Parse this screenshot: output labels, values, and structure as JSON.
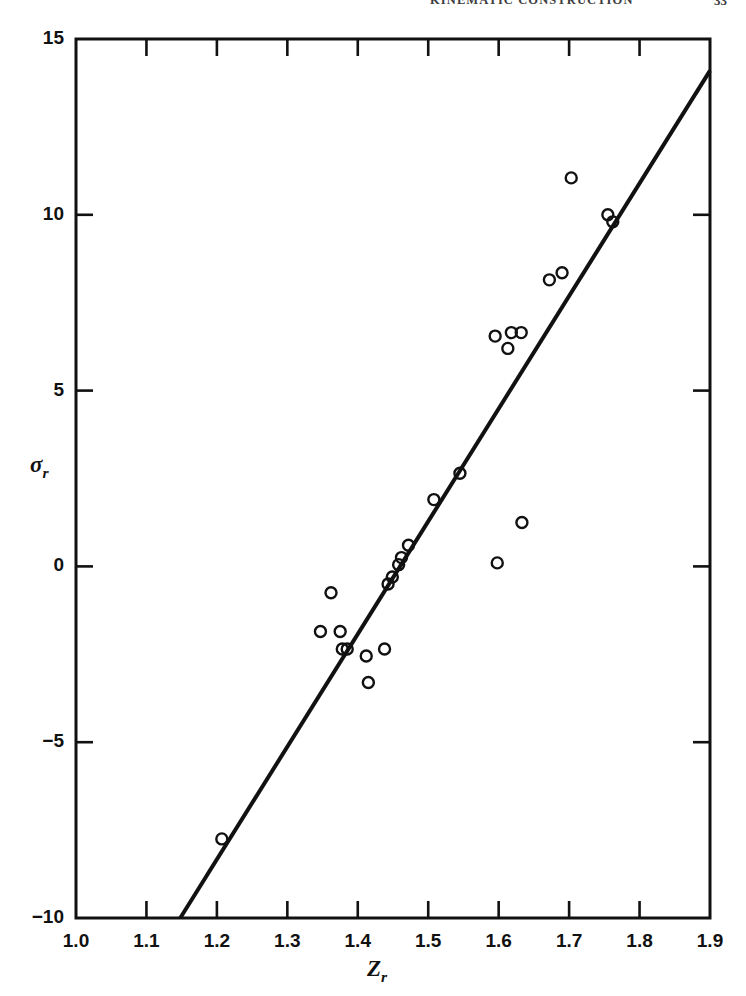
{
  "running_head": {
    "title": "KINEMATIC CONSTRUCTION",
    "page_number": "33"
  },
  "figure": {
    "x_axis_label": "Z",
    "x_axis_label_sub": "r",
    "y_axis_label": "σ",
    "y_axis_label_sub": "r"
  },
  "chart_data": {
    "type": "scatter",
    "title": "",
    "xlabel": "Z_r",
    "ylabel": "sigma_r",
    "xlim": [
      1.0,
      1.9
    ],
    "ylim": [
      -10,
      15
    ],
    "xticks": [
      1.0,
      1.1,
      1.2,
      1.3,
      1.4,
      1.5,
      1.6,
      1.7,
      1.8,
      1.9
    ],
    "xtick_labels": [
      "1.0",
      "1.1",
      "1.2",
      "1.3",
      "1.4",
      "1.5",
      "1.6",
      "1.7",
      "1.8",
      "1.9"
    ],
    "yticks": [
      -10,
      -5,
      0,
      5,
      10,
      15
    ],
    "ytick_labels": [
      "-10",
      "-5",
      "0",
      "5",
      "10",
      "15"
    ],
    "x_minor_ticks": [
      1.1,
      1.2,
      1.3,
      1.4,
      1.5,
      1.6,
      1.7,
      1.8
    ],
    "y_minor_ticks": [
      -5,
      0,
      5,
      10
    ],
    "grid": false,
    "legend": false,
    "marker": "open-circle",
    "marker_size_px": 11,
    "series": [
      {
        "name": "observations",
        "points": [
          [
            1.207,
            -7.75
          ],
          [
            1.347,
            -1.85
          ],
          [
            1.362,
            -0.75
          ],
          [
            1.375,
            -1.85
          ],
          [
            1.378,
            -2.35
          ],
          [
            1.385,
            -2.35
          ],
          [
            1.412,
            -2.55
          ],
          [
            1.415,
            -3.3
          ],
          [
            1.438,
            -2.35
          ],
          [
            1.443,
            -0.5
          ],
          [
            1.449,
            -0.3
          ],
          [
            1.458,
            0.05
          ],
          [
            1.462,
            0.25
          ],
          [
            1.472,
            0.6
          ],
          [
            1.508,
            1.9
          ],
          [
            1.545,
            2.65
          ],
          [
            1.595,
            6.55
          ],
          [
            1.598,
            0.1
          ],
          [
            1.613,
            6.2
          ],
          [
            1.618,
            6.65
          ],
          [
            1.632,
            6.65
          ],
          [
            1.633,
            1.25
          ],
          [
            1.672,
            8.15
          ],
          [
            1.69,
            8.35
          ],
          [
            1.703,
            11.05
          ],
          [
            1.755,
            10.0
          ],
          [
            1.762,
            9.8
          ]
        ]
      }
    ],
    "fit_line": {
      "name": "regression-line",
      "start": [
        1.148,
        -10.0
      ],
      "end": [
        1.9,
        14.1
      ],
      "slope": 32.05,
      "intercept": -46.79,
      "width_px": 4,
      "color": "#111111"
    }
  }
}
